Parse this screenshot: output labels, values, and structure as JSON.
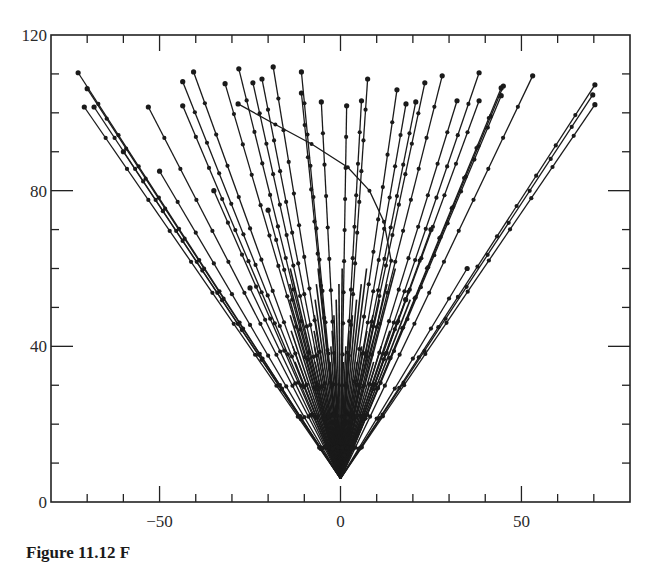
{
  "chart_data": {
    "type": "line",
    "title": "",
    "xlabel": "",
    "ylabel": "",
    "xlim": [
      -80,
      80
    ],
    "ylim": [
      0,
      120
    ],
    "x_ticks_major": [
      -50,
      0,
      50
    ],
    "x_tick_labels": [
      "−50",
      "0",
      "50"
    ],
    "x_ticks_minor_step": 10,
    "y_ticks_major": [
      0,
      40,
      80,
      120
    ],
    "y_tick_labels": [
      "0",
      "40",
      "80",
      "120"
    ],
    "y_ticks_minor_step": 10,
    "grid": false,
    "legend": null,
    "marker": "filled-circle",
    "marker_spacing_y": 8,
    "line_color": "#1a1a1a",
    "origin": [
      0,
      6
    ],
    "series": [
      {
        "name": "track-1",
        "end": [
          -72.5,
          110.3
        ]
      },
      {
        "name": "track-2",
        "end": [
          -70.0,
          106.2
        ]
      },
      {
        "name": "track-3",
        "end": [
          -70.8,
          101.5
        ]
      },
      {
        "name": "track-4",
        "end": [
          -68.1,
          101.5
        ]
      },
      {
        "name": "track-5",
        "end": [
          -53.1,
          101.5
        ]
      },
      {
        "name": "track-6",
        "end": [
          -43.6,
          108.0
        ]
      },
      {
        "name": "track-7",
        "end": [
          -43.6,
          101.8
        ]
      },
      {
        "name": "track-8",
        "end": [
          -40.6,
          110.5
        ]
      },
      {
        "name": "track-9",
        "end": [
          -31.9,
          107.5
        ]
      },
      {
        "name": "track-10",
        "end": [
          -28.1,
          111.3
        ]
      },
      {
        "name": "track-11",
        "end": [
          -24.2,
          107.7
        ]
      },
      {
        "name": "track-12",
        "end": [
          -21.7,
          108.7
        ]
      },
      {
        "name": "track-13",
        "end": [
          -18.6,
          111.8
        ]
      },
      {
        "name": "track-14",
        "end": [
          -10.8,
          110.5
        ]
      },
      {
        "name": "track-15",
        "end": [
          -10.8,
          105.1
        ]
      },
      {
        "name": "track-16",
        "end": [
          -5.3,
          102.8
        ]
      },
      {
        "name": "track-17",
        "end": [
          1.7,
          101.8
        ]
      },
      {
        "name": "track-18",
        "end": [
          5.8,
          103.1
        ]
      },
      {
        "name": "track-19",
        "end": [
          7.5,
          108.7
        ]
      },
      {
        "name": "track-20",
        "end": [
          15.6,
          105.9
        ]
      },
      {
        "name": "track-21",
        "end": [
          18.1,
          102.3
        ]
      },
      {
        "name": "track-22",
        "end": [
          20.8,
          102.8
        ]
      },
      {
        "name": "track-23",
        "end": [
          23.3,
          107.7
        ]
      },
      {
        "name": "track-24",
        "end": [
          28.1,
          109.5
        ]
      },
      {
        "name": "track-25",
        "end": [
          32.2,
          103.1
        ]
      },
      {
        "name": "track-26",
        "end": [
          38.3,
          110.3
        ]
      },
      {
        "name": "track-27",
        "end": [
          38.3,
          103.1
        ]
      },
      {
        "name": "track-28",
        "end": [
          44.4,
          106.4
        ]
      },
      {
        "name": "track-29",
        "end": [
          45.0,
          106.9
        ]
      },
      {
        "name": "track-30",
        "end": [
          44.4,
          104.4
        ]
      },
      {
        "name": "track-31",
        "end": [
          53.1,
          109.5
        ]
      },
      {
        "name": "track-32",
        "end": [
          70.3,
          107.2
        ]
      },
      {
        "name": "track-33",
        "end": [
          69.7,
          104.6
        ]
      },
      {
        "name": "track-34",
        "end": [
          70.3,
          102.1
        ]
      },
      {
        "name": "track-35",
        "end": [
          -60.0,
          90.0
        ]
      },
      {
        "name": "track-36",
        "end": [
          -50.0,
          85.0
        ]
      },
      {
        "name": "track-37",
        "end": [
          -35.0,
          80.0
        ]
      },
      {
        "name": "track-38",
        "end": [
          -20.0,
          75.0
        ]
      },
      {
        "name": "track-39",
        "end": [
          25.0,
          70.0
        ]
      },
      {
        "name": "track-40",
        "end": [
          35.0,
          60.0
        ]
      },
      {
        "name": "track-41",
        "end": [
          -25.0,
          55.0
        ]
      },
      {
        "name": "track-42",
        "end": [
          18.0,
          52.0
        ]
      }
    ],
    "curved_series": [
      {
        "name": "curved-track",
        "points": [
          [
            -28.3,
            102.3
          ],
          [
            -18,
            97
          ],
          [
            -8,
            92
          ],
          [
            2,
            86
          ],
          [
            8,
            80
          ],
          [
            12,
            72
          ],
          [
            14,
            62
          ],
          [
            10,
            45
          ],
          [
            5,
            28
          ],
          [
            1,
            12
          ],
          [
            0,
            6
          ]
        ]
      }
    ]
  },
  "caption": {
    "visible_text": "Figure 11.12  F"
  }
}
